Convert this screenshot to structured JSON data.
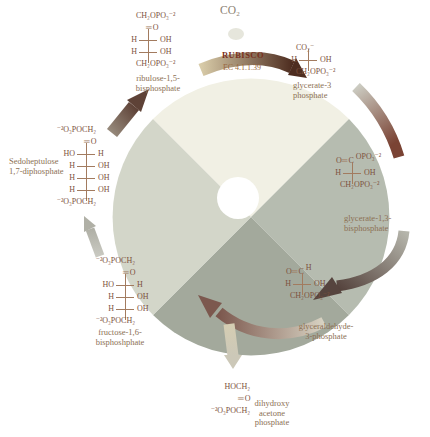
{
  "co2": "CO₂",
  "rubisco": {
    "label": "RUBISCO",
    "ec": "EC 4.1.1.39"
  },
  "compounds": {
    "ribulose_15_bisphosphate": {
      "label": [
        "ribulose-1,5-",
        "bisphosphate"
      ],
      "rows": [
        {
          "t": "f",
          "v": "CH₂OPO₃⁻²"
        },
        {
          "t": "d",
          "v": "O"
        },
        {
          "t": "b",
          "l": "H",
          "r": "OH"
        },
        {
          "t": "b",
          "l": "H",
          "r": "OH"
        },
        {
          "t": "f",
          "v": "CH₂OPO₃⁻²"
        }
      ]
    },
    "glycerate_3_phosphate": {
      "label": [
        "glycerate-3",
        "phosphate"
      ],
      "rows": [
        {
          "t": "f",
          "v": "CO₂⁻"
        },
        {
          "t": "b",
          "l": "H",
          "r": "OH"
        },
        {
          "t": "f",
          "v": "CH₂OPO₃⁻²"
        }
      ]
    },
    "glycerate_13_bisphosphate": {
      "label": [
        "glycerate-1,3-",
        "bisphosphate"
      ],
      "rows": [
        {
          "t": "cl",
          "l": "O",
          "c": "C",
          "r": "OPO₃⁻²"
        },
        {
          "t": "b",
          "l": "H",
          "r": "OH"
        },
        {
          "t": "f",
          "v": "CH₂OPO₃⁻²"
        }
      ]
    },
    "glyceraldehyde_3_phosphate": {
      "label": [
        "glyceraldehyde-",
        "3-phosphate"
      ],
      "rows": [
        {
          "t": "cl",
          "l": "O",
          "c": "C",
          "r": "H"
        },
        {
          "t": "b",
          "l": "H",
          "r": "OH"
        },
        {
          "t": "f",
          "v": "CH₂OPO₃⁻²"
        }
      ]
    },
    "dihydroxyacetone_phosphate": {
      "label": [
        "dihydroxy",
        "acetone",
        "phosphate"
      ],
      "rows": [
        {
          "t": "fl",
          "v": "HOCH₂"
        },
        {
          "t": "d",
          "v": "O"
        },
        {
          "t": "fl",
          "v": "⁻²O₃POCH₂"
        }
      ]
    },
    "fructose_16_bisphosphate": {
      "label": [
        "fructose-1,6-",
        "bisphoshphate"
      ],
      "rows": [
        {
          "t": "fl",
          "v": "⁻²O₃POCH₂"
        },
        {
          "t": "d",
          "v": "O"
        },
        {
          "t": "b",
          "l": "HO",
          "r": "H"
        },
        {
          "t": "b",
          "l": "H",
          "r": "OH"
        },
        {
          "t": "b",
          "l": "H",
          "r": "OH"
        },
        {
          "t": "fl",
          "v": "⁻²O₃POCH₂"
        }
      ]
    },
    "sedoheptulose_17_diphosphate": {
      "label": [
        "Sedoheptulose",
        "1,7-diphosphate"
      ],
      "rows": [
        {
          "t": "fl",
          "v": "⁻²O₃POCH₂"
        },
        {
          "t": "d",
          "v": "O"
        },
        {
          "t": "b",
          "l": "HO",
          "r": "H"
        },
        {
          "t": "b",
          "l": "H",
          "r": "OH"
        },
        {
          "t": "b",
          "l": "H",
          "r": "OH"
        },
        {
          "t": "b",
          "l": "H",
          "r": "OH"
        },
        {
          "t": "fl",
          "v": "⁻²O₃POCH₂"
        }
      ]
    }
  },
  "colors": {
    "wedge_top": "#f1f0e4",
    "wedge_right": "#b6bcb0",
    "wedge_bottom": "#a3a99c",
    "wedge_left": "#d3d6c9",
    "hole": "#ffffff",
    "dot": "#e6e6dc",
    "rubisco_from": "#d8cba8",
    "rubisco_to": "#4e2d20",
    "arc_right_upper_from": "#ccccc2",
    "arc_right_upper_to": "#7a4334",
    "arc_right_lower_from": "#b5b5ab",
    "arc_right_lower_to": "#56443e",
    "arc_bottom_from": "#d8d3c3",
    "arc_bottom_to": "#7c584e",
    "branch_from": "#d5cdb2",
    "branch_to": "#ccc8b8",
    "left_up_from": "#c9c9c1",
    "left_up_to": "#b0b0a6",
    "upper_left_from": "#96897b",
    "upper_left_to": "#5e4237",
    "ink": "#7d513d",
    "bond": "#a27b5f",
    "label_ink": "#8c7054",
    "rubisco_ink": "#7a3020",
    "ec_ink": "#9a6840",
    "co2_ink": "#8b8274"
  }
}
